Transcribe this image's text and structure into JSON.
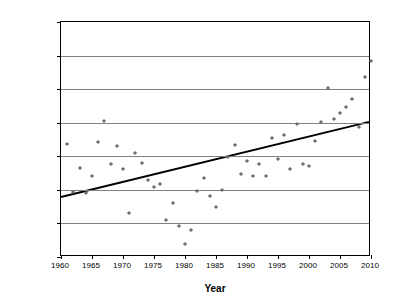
{
  "chart_data": {
    "type": "scatter",
    "title": "",
    "xlabel": "Year",
    "ylabel": "Mean Minimum Temperature (°C)",
    "xlim": [
      1960,
      2010
    ],
    "ylim": [
      19.5,
      23
    ],
    "xticks": [
      1960,
      1965,
      1970,
      1975,
      1980,
      1985,
      1990,
      1995,
      2000,
      2005,
      2010
    ],
    "yticks": [
      19.5,
      20,
      20.5,
      21,
      21.5,
      22,
      22.5,
      23
    ],
    "grid": "horizontal",
    "legend": "none",
    "marker": "diamond",
    "marker_color": "#6e6e6e",
    "series": [
      {
        "name": "Mean Minimum Temperature",
        "x": [
          1961,
          1962,
          1963,
          1964,
          1965,
          1966,
          1967,
          1968,
          1969,
          1970,
          1971,
          1972,
          1973,
          1974,
          1975,
          1976,
          1977,
          1978,
          1979,
          1980,
          1981,
          1982,
          1983,
          1984,
          1985,
          1986,
          1987,
          1988,
          1989,
          1990,
          1991,
          1992,
          1993,
          1994,
          1995,
          1996,
          1997,
          1998,
          1999,
          2000,
          2001,
          2002,
          2003,
          2004,
          2005,
          2006,
          2007,
          2008,
          2009
        ],
        "y": [
          21.18,
          20.47,
          20.83,
          20.45,
          20.71,
          21.21,
          21.52,
          20.88,
          21.15,
          20.81,
          20.15,
          21.05,
          20.9,
          20.65,
          20.54,
          20.59,
          20.05,
          20.31,
          19.96,
          19.69,
          19.9,
          20.48,
          20.68,
          20.41,
          20.24,
          20.5,
          20.99,
          21.17,
          20.74,
          20.93,
          20.7,
          20.88,
          20.71,
          21.27,
          20.96,
          21.31,
          20.81,
          21.48,
          20.88,
          20.85,
          21.23,
          21.51,
          22.02,
          21.55,
          21.65,
          21.74,
          21.85,
          21.44,
          22.18
        ],
        "last_point_year": 2010,
        "last_point_value": 22.42
      }
    ],
    "trendline": {
      "type": "linear",
      "x": [
        1960,
        2010
      ],
      "y": [
        20.37,
        21.5
      ],
      "color": "#000000"
    }
  },
  "axis": {
    "y_tick_labels": [
      "23",
      "22.5",
      "22",
      "21.5",
      "21",
      "20.5",
      "20",
      "19.5"
    ],
    "x_tick_labels": [
      "1960",
      "1965",
      "1970",
      "1975",
      "1980",
      "1985",
      "1990",
      "1995",
      "2000",
      "2005",
      "2010"
    ],
    "y_title": "Mean Minimum Temperature (°C)",
    "x_title": "Year"
  }
}
